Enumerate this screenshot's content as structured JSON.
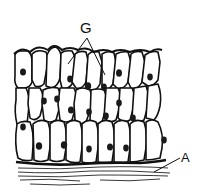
{
  "figure": {
    "labels": [
      {
        "id": "G",
        "text": "G",
        "points_to": "two cells at apical surface"
      },
      {
        "id": "A",
        "text": "A",
        "points_to": "underlying connective tissue layer"
      }
    ],
    "colors": {
      "ink": "#111111",
      "background": "#ffffff",
      "cell_fill": "#ffffff",
      "nucleus_fill": "#1a1a1a"
    }
  }
}
